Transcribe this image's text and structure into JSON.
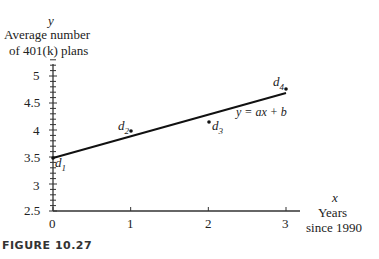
{
  "chart_data": {
    "type": "scatter",
    "title": "",
    "figure_caption": "FIGURE 10.27",
    "xlabel_var": "x",
    "xlabel": "Years since 1990",
    "xlabel_lines": [
      "Years",
      "since 1990"
    ],
    "ylabel_var": "y",
    "ylabel": "Average number of 401(k) plans",
    "ylabel_lines": [
      "Average number",
      "of 401(k) plans"
    ],
    "xlim": [
      0,
      3.2
    ],
    "ylim": [
      2.5,
      5.3
    ],
    "x_ticks": [
      "0",
      "1",
      "2",
      "3"
    ],
    "y_ticks": [
      "2.5",
      "3",
      "3.5",
      "4",
      "4.5",
      "5"
    ],
    "y_minor_tick_step": 0.1,
    "grid": false,
    "series": [
      {
        "name": "data points",
        "kind": "scatter",
        "point_labels": [
          "d1",
          "d2",
          "d3",
          "d4"
        ]
      },
      {
        "name": "y = ax + b",
        "kind": "line"
      }
    ],
    "annotations": [
      "y = ax + b",
      "d1",
      "d2",
      "d3",
      "d4"
    ]
  },
  "plot_geometry": {
    "note": "pixel positions of visible marks, measured from the screenshot; not data values",
    "points_px": {
      "d1": [
        53,
        158
      ],
      "d2": [
        131,
        131
      ],
      "d3": [
        209,
        122
      ],
      "d4": [
        286,
        89
      ]
    },
    "line_px": [
      [
        53,
        158
      ],
      [
        286,
        93
      ]
    ]
  },
  "labels": {
    "y_var": "y",
    "y_line1": "Average number",
    "y_line2": "of 401(k) plans",
    "x_var": "x",
    "x_line1": "Years",
    "x_line2": "since 1990",
    "eq": "y = ax + b",
    "d1": "d",
    "d1_sub": "1",
    "d2": "d",
    "d2_sub": "2",
    "d3": "d",
    "d3_sub": "3",
    "d4": "d",
    "d4_sub": "4",
    "caption": "FIGURE 10.27",
    "yt": [
      "5",
      "4.5",
      "4",
      "3.5",
      "3",
      "2.5"
    ],
    "xt": [
      "0",
      "1",
      "2",
      "3"
    ]
  }
}
